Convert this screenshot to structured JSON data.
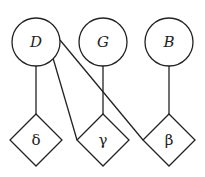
{
  "diagram": {
    "type": "bipartite-graph",
    "circle_nodes": [
      {
        "id": "D",
        "label": "D",
        "cx": 36,
        "cy": 42
      },
      {
        "id": "G",
        "label": "G",
        "cx": 103,
        "cy": 42
      },
      {
        "id": "B",
        "label": "B",
        "cx": 169,
        "cy": 42
      }
    ],
    "diamond_nodes": [
      {
        "id": "delta",
        "label": "δ",
        "cx": 36,
        "cy": 140
      },
      {
        "id": "gamma",
        "label": "γ",
        "cx": 103,
        "cy": 140
      },
      {
        "id": "beta",
        "label": "β",
        "cx": 169,
        "cy": 140
      }
    ],
    "edges": [
      {
        "from": "D",
        "to": "delta"
      },
      {
        "from": "D",
        "to": "gamma"
      },
      {
        "from": "D",
        "to": "beta"
      },
      {
        "from": "G",
        "to": "gamma"
      },
      {
        "from": "B",
        "to": "beta"
      }
    ]
  }
}
